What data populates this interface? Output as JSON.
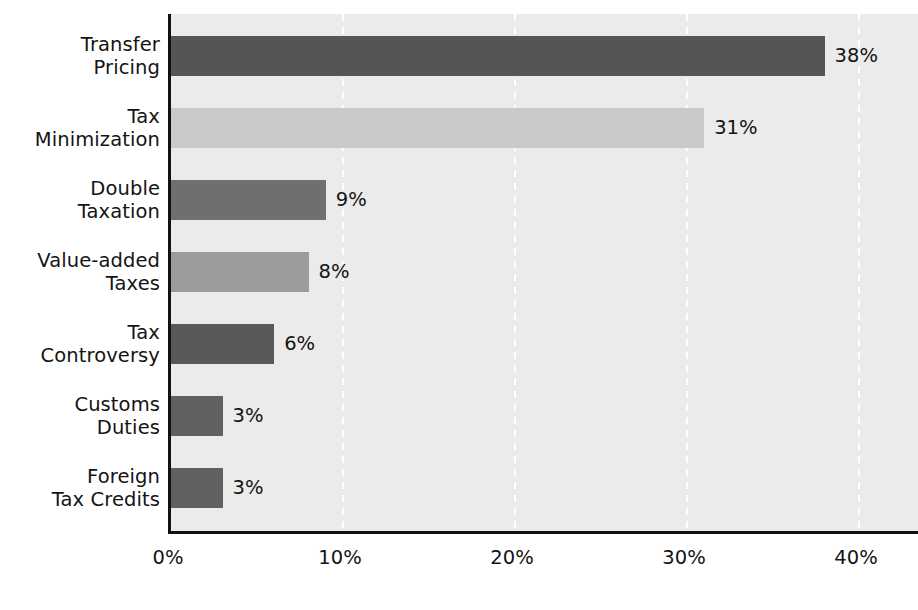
{
  "chart_data": {
    "type": "bar",
    "orientation": "horizontal",
    "title": "",
    "xlabel": "",
    "ylabel": "",
    "xlim": [
      0,
      40
    ],
    "xticks": [
      0,
      10,
      20,
      30,
      40
    ],
    "xtick_labels": [
      "0%",
      "10%",
      "20%",
      "30%",
      "40%"
    ],
    "grid": "vertical-dashed-white",
    "legend": "none",
    "categories": [
      "Transfer\nPricing",
      "Tax\nMinimization",
      "Double\nTaxation",
      "Value-added\nTaxes",
      "Tax\nControversy",
      "Customs\nDuties",
      "Foreign\nTax Credits"
    ],
    "values": [
      38,
      31,
      9,
      8,
      6,
      3,
      3
    ],
    "value_labels": [
      "38%",
      "31%",
      "9%",
      "8%",
      "6%",
      "3%",
      "3%"
    ],
    "bar_colors": [
      "#555555",
      "#c9c9c9",
      "#6f6f6f",
      "#9b9b9b",
      "#585858",
      "#616161",
      "#616161"
    ],
    "plot_background": "#ebebeb",
    "axis_color": "#111111",
    "gridline_color": "#ffffff",
    "text_color": "#141414"
  }
}
